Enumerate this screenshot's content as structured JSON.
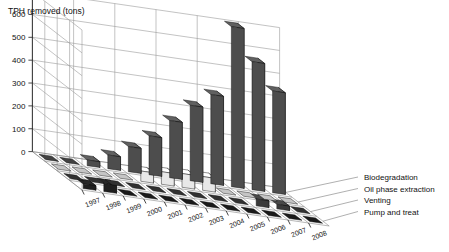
{
  "chart_data": {
    "type": "bar",
    "title": "",
    "subtitle": "",
    "ylabel": "TPH removed (tons)",
    "xlabel": "",
    "ylim": [
      0,
      700
    ],
    "yticks": [
      0,
      100,
      200,
      300,
      400,
      500,
      600,
      700
    ],
    "grid": true,
    "projection": "3d-grouped-columns",
    "legend_position": "right-inline-series-labels",
    "categories": [
      "1997",
      "1998",
      "1999",
      "2000",
      "2001",
      "2002",
      "2003",
      "2004",
      "2005",
      "2006",
      "2007",
      "2008"
    ],
    "series": [
      {
        "name": "Biodegradation",
        "color": "#4d4d4d",
        "values": [
          0,
          0,
          25,
          60,
          110,
          170,
          250,
          330,
          390,
          700,
          560,
          445
        ]
      },
      {
        "name": "Oil phase extraction",
        "color": "#e8e8e8",
        "values": [
          0,
          0,
          0,
          0,
          45,
          55,
          60,
          60,
          0,
          0,
          0,
          0
        ]
      },
      {
        "name": "Venting",
        "color": "#3a3a3a",
        "values": [
          0,
          0,
          0,
          0,
          0,
          0,
          0,
          0,
          0,
          30,
          20,
          0
        ]
      },
      {
        "name": "Pump and treat",
        "color": "#1f1f1f",
        "values": [
          20,
          35,
          0,
          0,
          0,
          0,
          0,
          0,
          0,
          0,
          0,
          0
        ]
      }
    ]
  },
  "axis": {
    "y_title": "TPH removed (tons)"
  },
  "series_labels": {
    "s0": "Biodegradation",
    "s1": "Oil phase extraction",
    "s2": "Venting",
    "s3": "Pump and treat"
  }
}
